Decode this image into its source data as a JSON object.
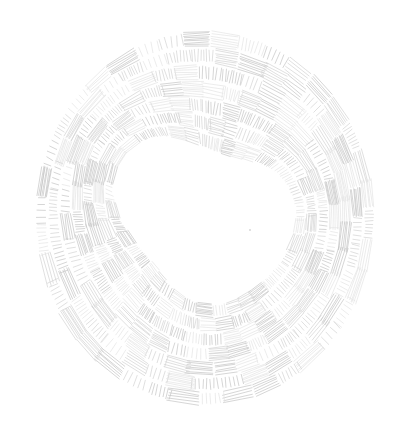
{
  "image": {
    "subject": "hatched ink ring drawing",
    "description": "A loose hand-drawn ring made of many small patches of short parallel hatch lines in light gray on white paper",
    "colors": {
      "background": "#ffffff",
      "ink_light": "#e4e4e4",
      "ink_mid": "#d2d2d2",
      "ink_dark": "#c4c4c4"
    }
  }
}
